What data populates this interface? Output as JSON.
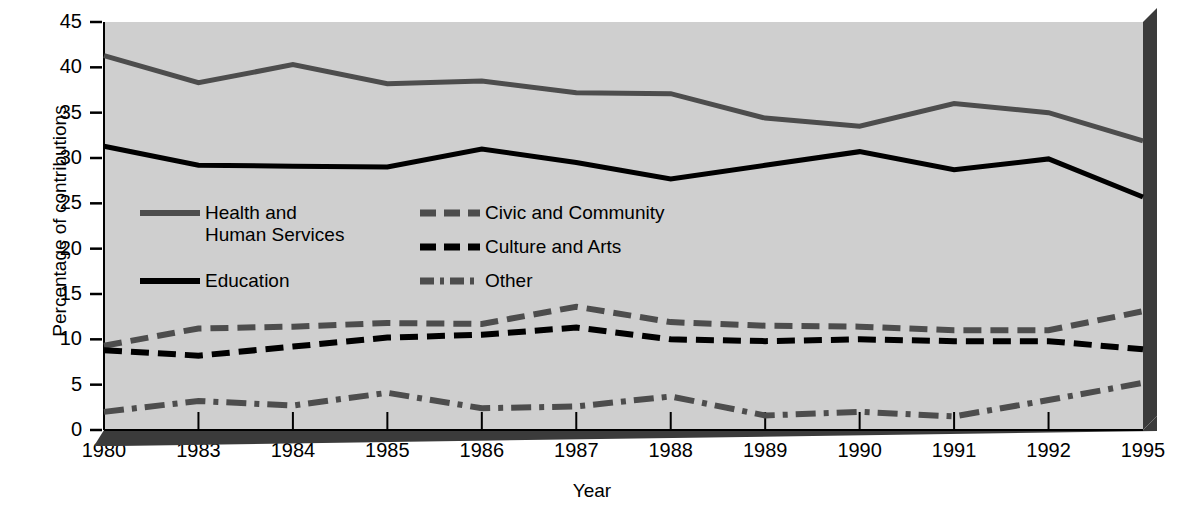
{
  "chart_data": {
    "type": "line",
    "title": "",
    "xlabel": "Year",
    "ylabel": "Percentage of contributions",
    "categories": [
      "1980",
      "1983",
      "1984",
      "1985",
      "1986",
      "1987",
      "1988",
      "1989",
      "1990",
      "1991",
      "1992",
      "1995"
    ],
    "x_tick_labels": [
      "1980",
      "1983",
      "1984",
      "1985",
      "1986",
      "1987",
      "1988",
      "1989",
      "1990",
      "1991",
      "1992",
      "1995"
    ],
    "y_tick_labels": [
      "0",
      "5",
      "10",
      "15",
      "20",
      "25",
      "30",
      "35",
      "40",
      "45"
    ],
    "ylim": [
      0,
      45
    ],
    "y_major_step": 5,
    "grid": false,
    "legend_position": "inside-upper-left",
    "series": [
      {
        "name": "Health and Human Services",
        "legend_label_line1": "Health and",
        "legend_label_line2": "Human Services",
        "style": "solid",
        "color": "#4d4d4d",
        "values": [
          41.3,
          38.3,
          40.3,
          38.2,
          38.5,
          37.2,
          37.1,
          34.4,
          33.5,
          36.0,
          35.0,
          31.9
        ]
      },
      {
        "name": "Education",
        "legend_label_line1": "Education",
        "style": "solid",
        "color": "#000000",
        "values": [
          31.3,
          29.2,
          29.1,
          29.0,
          31.0,
          29.5,
          27.7,
          29.2,
          30.7,
          28.7,
          29.9,
          25.7
        ]
      },
      {
        "name": "Civic and Community",
        "legend_label_line1": "Civic and Community",
        "style": "dashed",
        "color": "#4d4d4d",
        "values": [
          9.3,
          11.2,
          11.4,
          11.8,
          11.7,
          13.6,
          11.9,
          11.5,
          11.4,
          11.0,
          11.0,
          13.1
        ]
      },
      {
        "name": "Culture and Arts",
        "legend_label_line1": "Culture and Arts",
        "style": "dashed",
        "color": "#000000",
        "values": [
          8.8,
          8.2,
          9.2,
          10.2,
          10.5,
          11.3,
          10.0,
          9.8,
          10.0,
          9.8,
          9.8,
          8.9
        ]
      },
      {
        "name": "Other",
        "legend_label_line1": "Other",
        "style": "dashdot",
        "color": "#4d4d4d",
        "values": [
          2.0,
          3.2,
          2.7,
          4.1,
          2.4,
          2.6,
          3.7,
          1.6,
          2.0,
          1.5,
          3.3,
          5.2
        ]
      }
    ]
  },
  "axes": {
    "y_title": "Percentage of contributions",
    "x_title": "Year"
  },
  "legend": {
    "entries": [
      {
        "label_line1": "Health and",
        "label_line2": "Human Services",
        "style": "solid",
        "color": "#4d4d4d"
      },
      {
        "label_line1": "Education",
        "label_line2": "",
        "style": "solid",
        "color": "#000000"
      },
      {
        "label_line1": "Civic and Community",
        "label_line2": "",
        "style": "dashed",
        "color": "#4d4d4d"
      },
      {
        "label_line1": "Culture and Arts",
        "label_line2": "",
        "style": "dashed",
        "color": "#000000"
      },
      {
        "label_line1": "Other",
        "label_line2": "",
        "style": "dashdot",
        "color": "#4d4d4d"
      }
    ]
  },
  "style": {
    "plot_background": "#cfcfcf",
    "shadow_color": "#3b3b3b",
    "page_background": "#ffffff",
    "text_color": "#000000"
  }
}
